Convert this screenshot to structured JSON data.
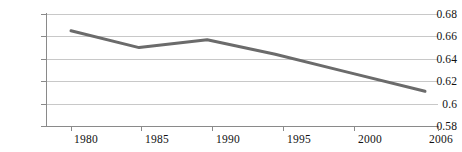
{
  "chart_data": {
    "type": "line",
    "title": "",
    "subtitle": "",
    "xlabel": "",
    "ylabel": "",
    "categories": [
      "1980",
      "1985",
      "1990",
      "1995",
      "2000",
      "2006"
    ],
    "x": [
      1980,
      1985,
      1990,
      1995,
      2000,
      2006
    ],
    "values": [
      0.665,
      0.65,
      0.657,
      0.644,
      0.629,
      0.611
    ],
    "series": [
      {
        "name": "",
        "values": [
          0.665,
          0.65,
          0.657,
          0.644,
          0.629,
          0.611
        ]
      }
    ],
    "ylim": [
      0.58,
      0.68
    ],
    "xlim": [
      1980,
      2006
    ],
    "ytick_labels": [
      "0.68",
      "0.66",
      "0.64",
      "0.62",
      "0.6",
      "0.58"
    ],
    "ytick_values": [
      0.68,
      0.66,
      0.64,
      0.62,
      0.6,
      0.58
    ],
    "xtick_labels": [
      "1980",
      "1985",
      "1990",
      "1995",
      "2000",
      "2006"
    ],
    "grid": true,
    "grid_axis": "y",
    "legend": false,
    "legend_position": "none",
    "annotations": [],
    "colors": {
      "line": "#6b6b6b",
      "gridline": "#c8c8c8",
      "axis": "#8a8a8a",
      "text": "#111111",
      "background": "#ffffff"
    },
    "line_width": 3
  }
}
